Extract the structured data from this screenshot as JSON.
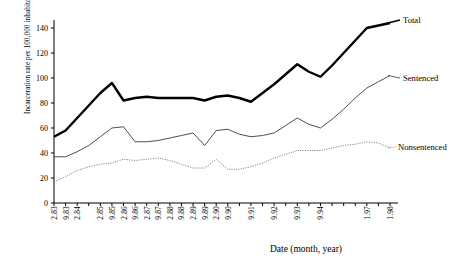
{
  "chart_data": {
    "type": "line",
    "title": "",
    "subtitle": "",
    "xlabel": "Date (month, year)",
    "ylabel": "Incarceration rate per 100,000 inhabitants",
    "ylim": [
      0,
      150
    ],
    "yticks": [
      0,
      20,
      40,
      60,
      80,
      100,
      120,
      140
    ],
    "grid": false,
    "legend_position": "right-inline-labels",
    "x_tick_labels": [
      "2.83",
      "9.83",
      "2.84",
      "",
      "2.85",
      "9.85",
      "2.86",
      "9.86",
      "2.87",
      "9.87",
      "2.88",
      "9.88",
      "2.89",
      "9.89",
      "2.90",
      "9.90",
      "",
      "9.91",
      "",
      "9.92",
      "",
      "9.93",
      "",
      "9.94",
      "",
      "",
      "",
      "1.97",
      "",
      "1.98"
    ],
    "x": [
      "2.83",
      "9.83",
      "2.84",
      "9.84",
      "2.85",
      "9.85",
      "2.86",
      "9.86",
      "2.87",
      "9.87",
      "2.88",
      "9.88",
      "2.89",
      "9.89",
      "2.90",
      "9.90",
      "2.91",
      "9.91",
      "2.92",
      "9.92",
      "2.93",
      "9.93",
      "2.94",
      "9.94",
      "2.95",
      "9.95",
      "2.96",
      "1.97",
      "9.97",
      "1.98"
    ],
    "series": [
      {
        "name": "Total",
        "style": "thick-solid",
        "color": "#000000",
        "values": [
          53,
          58,
          68,
          78,
          88,
          96,
          82,
          84,
          85,
          84,
          84,
          84,
          84,
          82,
          85,
          86,
          84,
          81,
          88,
          95,
          103,
          111,
          105,
          101,
          110,
          120,
          130,
          140,
          142,
          144
        ]
      },
      {
        "name": "Sentenced",
        "style": "thin-solid",
        "color": "#3a3a3a",
        "values": [
          37,
          37,
          41,
          46,
          53,
          60,
          61,
          49,
          49,
          50,
          52,
          54,
          56,
          46,
          58,
          59,
          55,
          53,
          54,
          56,
          62,
          68,
          63,
          60,
          67,
          75,
          84,
          92,
          97,
          102
        ]
      },
      {
        "name": "Nonsentenced",
        "style": "dotted",
        "color": "#7a7a7a",
        "values": [
          17,
          21,
          26,
          29,
          31,
          32,
          35,
          34,
          35,
          36,
          34,
          31,
          28,
          28,
          35,
          27,
          27,
          29,
          32,
          36,
          39,
          42,
          42,
          42,
          44,
          46,
          47,
          49,
          48,
          44
        ]
      }
    ],
    "axis": {
      "x_tick_count": 30,
      "x_min_index": 0,
      "x_max_index": 29
    }
  },
  "labels": {
    "ylabel": "Incarceration rate per 100,000 inhabitants",
    "xlabel": "Date (month, year)",
    "total": "Total",
    "sentenced": "Sentenced",
    "nonsentenced": "Nonsentenced"
  }
}
